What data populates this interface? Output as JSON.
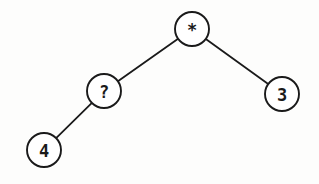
{
  "diagram": {
    "type": "binary-expression-tree",
    "nodes": [
      {
        "id": "root",
        "label": "*",
        "cx": 192,
        "cy": 29,
        "r": 17
      },
      {
        "id": "left",
        "label": "?",
        "cx": 104,
        "cy": 91,
        "r": 17
      },
      {
        "id": "right",
        "label": "3",
        "cx": 282,
        "cy": 94,
        "r": 17
      },
      {
        "id": "left-left",
        "label": "4",
        "cx": 44,
        "cy": 150,
        "r": 17
      }
    ],
    "edges": [
      {
        "from": "root",
        "to": "left"
      },
      {
        "from": "root",
        "to": "right"
      },
      {
        "from": "left",
        "to": "left-left"
      }
    ]
  }
}
